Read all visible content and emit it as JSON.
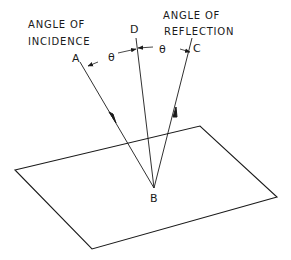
{
  "diagram": {
    "type": "reflection-geometry",
    "labels": {
      "incidence_line1": "ANGLE OF",
      "incidence_line2": "INCIDENCE",
      "reflection_line1": "ANGLE OF",
      "reflection_line2": "REFLECTION"
    },
    "points": {
      "A": "A",
      "B": "B",
      "C": "C",
      "D": "D"
    },
    "angles": {
      "incidence": "θ",
      "reflection": "θ"
    },
    "colors": {
      "line": "#1a1a1a",
      "background": "#ffffff"
    }
  }
}
